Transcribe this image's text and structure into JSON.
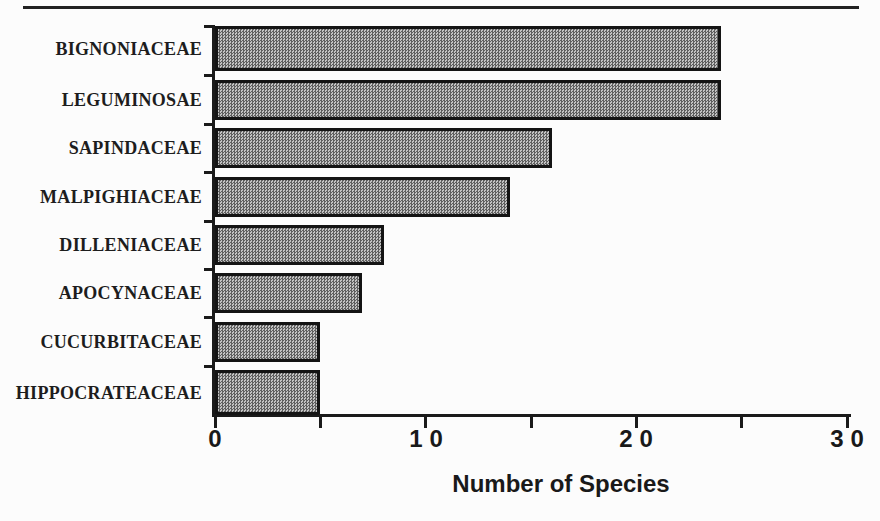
{
  "chart_data": {
    "type": "bar",
    "orientation": "horizontal",
    "title": "",
    "categories": [
      "BIGNONIACEAE",
      "LEGUMINOSAE",
      "SAPINDACEAE",
      "MALPIGHIACEAE",
      "DILLENIACEAE",
      "APOCYNACEAE",
      "CUCURBITACEAE",
      "HIPPOCRATEACEAE"
    ],
    "values": [
      24,
      24,
      16,
      14,
      8,
      7,
      5,
      5
    ],
    "xlabel": "Number of Species",
    "ylabel": "",
    "xlim": [
      0,
      30
    ],
    "xticks": [
      0,
      10,
      20,
      30
    ],
    "minor_xticks": [
      5,
      15,
      25
    ],
    "grid": false,
    "legend": false,
    "bar_style": "stippled-checker-gray",
    "colors": {
      "bar_pattern_dark": "#5f5f5f",
      "bar_pattern_light": "#c3c3c3",
      "bar_border": "#141414",
      "axis": "#1a1a1a",
      "text": "#1d1d1d",
      "background": "#fcfcfc"
    }
  }
}
